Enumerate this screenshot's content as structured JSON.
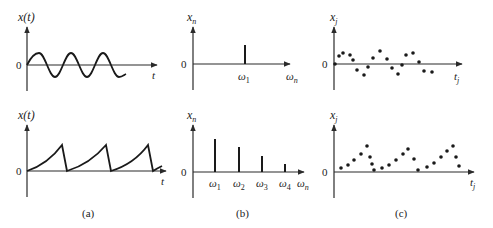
{
  "figure": {
    "panels": [
      {
        "id": "a",
        "caption": "(a)",
        "top": {
          "ylabel_main": "x",
          "ylabel_arg": "(t)",
          "xlabel": "t",
          "zero_label": "0",
          "description": "harmonic (sinusoidal) signal"
        },
        "bottom": {
          "ylabel_main": "x",
          "ylabel_arg": "(t)",
          "xlabel": "t",
          "zero_label": "0",
          "description": "periodic sawtooth-like signal"
        }
      },
      {
        "id": "b",
        "caption": "(b)",
        "top": {
          "ylabel_main": "x",
          "ylabel_sub": "n",
          "xlabel_main": "ω",
          "xlabel_sub": "n",
          "zero_label": "0",
          "spike_labels": [
            {
              "main": "ω",
              "sub": "1"
            }
          ],
          "description": "single spectral line"
        },
        "bottom": {
          "ylabel_main": "x",
          "ylabel_sub": "n",
          "xlabel_main": "ω",
          "xlabel_sub": "n",
          "zero_label": "0",
          "spike_labels": [
            {
              "main": "ω",
              "sub": "1"
            },
            {
              "main": "ω",
              "sub": "2"
            },
            {
              "main": "ω",
              "sub": "3"
            },
            {
              "main": "ω",
              "sub": "4"
            }
          ],
          "description": "discrete spectrum with decreasing amplitudes"
        }
      },
      {
        "id": "c",
        "caption": "(c)",
        "top": {
          "ylabel_main": "x",
          "ylabel_sub": "j",
          "xlabel_main": "t",
          "xlabel_sub": "j",
          "zero_label": "0",
          "description": "sampled sinusoid"
        },
        "bottom": {
          "ylabel_main": "x",
          "ylabel_sub": "j",
          "xlabel_main": "t",
          "xlabel_sub": "j",
          "zero_label": "0",
          "description": "sampled sawtooth"
        }
      }
    ]
  }
}
